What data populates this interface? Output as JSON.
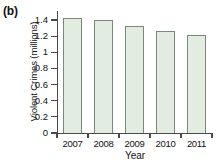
{
  "panel": {
    "label": "(b)"
  },
  "chart_data": {
    "type": "bar",
    "title": "",
    "xlabel": "Year",
    "ylabel": "Violent Crimes (millions)",
    "categories": [
      "2007",
      "2008",
      "2009",
      "2010",
      "2011"
    ],
    "values": [
      1.43,
      1.4,
      1.33,
      1.26,
      1.22
    ],
    "ylim": [
      0,
      1.5
    ],
    "yticks": [
      0,
      0.2,
      0.4,
      0.6,
      0.8,
      1,
      1.2,
      1.4
    ],
    "yticklabels": [
      "0",
      "0.2",
      "0.4",
      "0.6",
      "0.8",
      "1",
      "1.2",
      "1.4"
    ],
    "grid": false,
    "legend": null,
    "bar_fill_color": "#e3ece0",
    "bar_edge_color": "#79887a",
    "axis_color": "#4a4a4a",
    "background_color": "#ffffff"
  }
}
